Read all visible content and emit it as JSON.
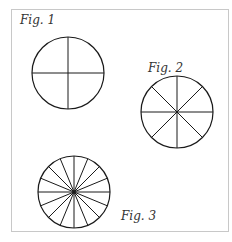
{
  "figures": [
    {
      "label": "Fig. 1",
      "center": [
        68,
        73
      ],
      "radius": 36,
      "sectors": 4
    },
    {
      "label": "Fig. 2",
      "center": [
        177,
        112
      ],
      "radius": 36,
      "sectors": 8
    },
    {
      "label": "Fig. 3",
      "center": [
        74,
        192
      ],
      "radius": 36,
      "sectors": 16
    }
  ],
  "colors": {
    "stroke": "#1a1a1a",
    "frame": "#c8c8c8"
  }
}
